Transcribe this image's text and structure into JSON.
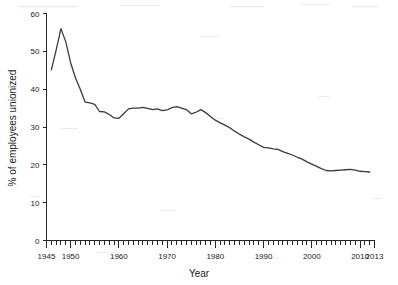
{
  "chart_data": {
    "type": "line",
    "title": "",
    "xlabel": "Year",
    "ylabel": "% of employees unionized",
    "xlim": [
      1945,
      2013
    ],
    "ylim": [
      0,
      60
    ],
    "grid": false,
    "legend": null,
    "x_tick_labels": [
      "1945",
      "1950",
      "1960",
      "1970",
      "1980",
      "1990",
      "2000",
      "2010",
      "2013"
    ],
    "x_tick_values": [
      1945,
      1950,
      1960,
      1970,
      1980,
      1990,
      2000,
      2010,
      2013
    ],
    "x_minor_tick_step": 1,
    "y_tick_labels": [
      "0",
      "10",
      "20",
      "30",
      "40",
      "50",
      "60"
    ],
    "y_tick_values": [
      0,
      10,
      20,
      30,
      40,
      50,
      60
    ],
    "series": [
      {
        "name": "% of employees unionized",
        "color": "#3a3a3a",
        "x": [
          1946,
          1947,
          1948,
          1949,
          1950,
          1951,
          1952,
          1953,
          1954,
          1955,
          1956,
          1957,
          1958,
          1959,
          1960,
          1961,
          1962,
          1963,
          1964,
          1965,
          1966,
          1967,
          1968,
          1969,
          1970,
          1971,
          1972,
          1973,
          1974,
          1975,
          1976,
          1977,
          1978,
          1979,
          1980,
          1981,
          1982,
          1983,
          1984,
          1985,
          1986,
          1987,
          1988,
          1989,
          1990,
          1991,
          1992,
          1993,
          1994,
          1995,
          1996,
          1997,
          1998,
          1999,
          2000,
          2001,
          2002,
          2003,
          2004,
          2005,
          2006,
          2007,
          2008,
          2009,
          2010,
          2011,
          2012
        ],
        "values": [
          45.1,
          50.3,
          56.0,
          52.5,
          47.0,
          43.0,
          40.0,
          36.6,
          36.4,
          36.0,
          34.1,
          34.0,
          33.3,
          32.4,
          32.3,
          33.5,
          34.8,
          35.0,
          35.0,
          35.2,
          34.9,
          34.6,
          34.8,
          34.3,
          34.5,
          35.1,
          35.4,
          35.0,
          34.6,
          33.5,
          33.9,
          34.6,
          33.8,
          32.8,
          31.8,
          31.1,
          30.5,
          29.8,
          28.9,
          28.1,
          27.4,
          26.8,
          26.0,
          25.3,
          24.6,
          24.5,
          24.2,
          24.1,
          23.5,
          23.0,
          22.6,
          22.0,
          21.5,
          20.8,
          20.2,
          19.6,
          19.0,
          18.5,
          18.4,
          18.5,
          18.6,
          18.7,
          18.8,
          18.6,
          18.3,
          18.2,
          18.1
        ]
      }
    ]
  },
  "axes": {
    "x_title": "Year",
    "y_title": "% of employees unionized"
  }
}
